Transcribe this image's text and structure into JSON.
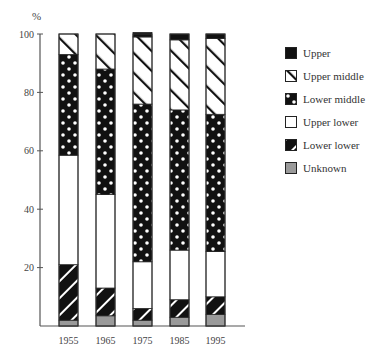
{
  "chart_data": {
    "type": "bar",
    "stacked": true,
    "title": "",
    "xlabel": "",
    "ylabel": "%",
    "ylim": [
      0,
      100
    ],
    "yticks": [
      20,
      40,
      60,
      80,
      100
    ],
    "grid": false,
    "legend_position": "right",
    "categories": [
      "1955",
      "1965",
      "1975",
      "1985",
      "1995"
    ],
    "series": [
      {
        "name": "Unknown",
        "pattern": "gray",
        "values": [
          2,
          3.5,
          2,
          3,
          4
        ]
      },
      {
        "name": "Lower lower",
        "pattern": "black-stripes",
        "values": [
          19,
          9.5,
          4,
          6,
          6
        ]
      },
      {
        "name": "Upper lower",
        "pattern": "white",
        "values": [
          37.5,
          32,
          16,
          17,
          15.5
        ]
      },
      {
        "name": "Lower middle",
        "pattern": "black-dots",
        "values": [
          34.5,
          43,
          54,
          48,
          47
        ]
      },
      {
        "name": "Upper middle",
        "pattern": "white-stripes",
        "values": [
          7,
          12,
          23,
          24,
          26
        ]
      },
      {
        "name": "Upper",
        "pattern": "black",
        "values": [
          0,
          0,
          1.5,
          2,
          1.5
        ]
      }
    ]
  },
  "axis": {
    "unit_label": "%",
    "tick_labels": [
      "20",
      "40",
      "60",
      "80",
      "100"
    ]
  },
  "legend": {
    "items": [
      {
        "label": "Upper",
        "pattern": "black"
      },
      {
        "label": "Upper middle",
        "pattern": "white-stripes"
      },
      {
        "label": "Lower middle",
        "pattern": "black-dots"
      },
      {
        "label": "Upper lower",
        "pattern": "white"
      },
      {
        "label": "Lower lower",
        "pattern": "black-stripes"
      },
      {
        "label": "Unknown",
        "pattern": "gray"
      }
    ]
  },
  "colors": {
    "black": "#111111",
    "gray": "#9a9a9a",
    "white": "#ffffff",
    "axis": "#555555"
  }
}
